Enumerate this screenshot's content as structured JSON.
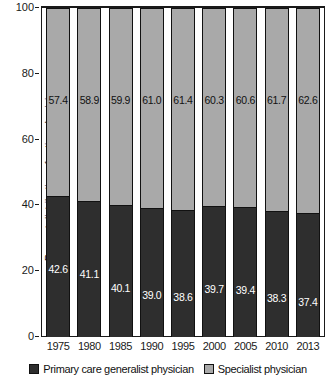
{
  "chart_data": {
    "type": "bar",
    "subtype": "stacked-bar-100-percent",
    "title": "",
    "xlabel": "",
    "ylabel": "Percent distribution of active physicians",
    "ylim": [
      0,
      100
    ],
    "yticks": [
      0,
      20,
      40,
      60,
      80,
      100
    ],
    "ytick_labels": [
      "0",
      "20",
      "40",
      "60",
      "80",
      "100"
    ],
    "grid": false,
    "legend_position": "bottom",
    "categories": [
      "1975",
      "1980",
      "1985",
      "1990",
      "1995",
      "2000",
      "2005",
      "2010",
      "2013"
    ],
    "series": [
      {
        "name": "Primary care generalist physician",
        "color": "#2e2e2e",
        "label_color": "#ffffff",
        "values": [
          42.6,
          41.1,
          40.1,
          39.0,
          38.6,
          39.7,
          39.4,
          38.3,
          37.4
        ],
        "value_labels": [
          "42.6",
          "41.1",
          "40.1",
          "39.0",
          "38.6",
          "39.7",
          "39.4",
          "38.3",
          "37.4"
        ],
        "label_offsets_px": [
          66,
          66,
          76,
          80,
          80,
          76,
          76,
          80,
          82
        ]
      },
      {
        "name": "Specialist physician",
        "color": "#a9a9a9",
        "label_color": "#111111",
        "values": [
          57.4,
          58.9,
          59.9,
          61.0,
          61.4,
          60.3,
          60.6,
          61.7,
          62.6
        ],
        "value_labels": [
          "57.4",
          "58.9",
          "59.9",
          "61.0",
          "61.4",
          "60.3",
          "60.6",
          "61.7",
          "62.6"
        ]
      }
    ]
  },
  "axis": {
    "y_title": "Percent distribution of active physicians",
    "y_tick_labels": [
      "100",
      "80",
      "60",
      "40",
      "20",
      "0"
    ],
    "x_tick_labels": [
      "1975",
      "1980",
      "1985",
      "1990",
      "1995",
      "2000",
      "2005",
      "2010",
      "2013"
    ]
  },
  "legend": {
    "items": [
      {
        "label": "Primary care generalist physician",
        "color": "#2e2e2e"
      },
      {
        "label": "Specialist physician",
        "color": "#a9a9a9"
      }
    ]
  },
  "colors": {
    "generalist": "#2e2e2e",
    "specialist": "#a9a9a9",
    "axis": "#1a1a1a",
    "background": "#ffffff"
  }
}
